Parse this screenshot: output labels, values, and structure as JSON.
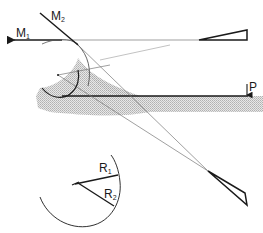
{
  "labels": {
    "m1": {
      "main": "M",
      "sub": "1"
    },
    "m2": {
      "main": "M",
      "sub": "2"
    },
    "p": {
      "main": "P"
    },
    "r1": {
      "main": "R",
      "sub": "1"
    },
    "r2": {
      "main": "R",
      "sub": "2"
    }
  },
  "colors": {
    "ink": "#1a1a1a",
    "thin_line": "#777777",
    "shading": "#c8c8c8"
  }
}
